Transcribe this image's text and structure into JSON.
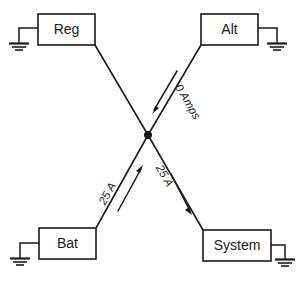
{
  "diagram": {
    "background_color": "#ffffff",
    "line_color": "#1a1a1a",
    "nodes": [
      {
        "id": "reg",
        "label": "Reg",
        "position": "top-left",
        "ground_side": "left"
      },
      {
        "id": "alt",
        "label": "Alt",
        "position": "top-right",
        "ground_side": "right"
      },
      {
        "id": "bat",
        "label": "Bat",
        "position": "bottom-left",
        "ground_side": "left"
      },
      {
        "id": "system",
        "label": "System",
        "position": "bottom-right",
        "ground_side": "right"
      }
    ],
    "junction": {
      "label": "junction",
      "x": 148,
      "y": 135
    },
    "connections": [
      {
        "id": "reg-junction",
        "from": "reg",
        "to": "junction",
        "label": "",
        "arrow": "none"
      },
      {
        "id": "alt-junction",
        "from": "alt",
        "to": "junction",
        "label": "0 Amps",
        "arrow": "toward-junction"
      },
      {
        "id": "bat-junction",
        "from": "bat",
        "to": "junction",
        "label": "25 A",
        "arrow": "toward-junction"
      },
      {
        "id": "junction-system",
        "from": "junction",
        "to": "system",
        "label": "25 A",
        "arrow": "away-from-junction"
      }
    ],
    "labels": {
      "alt_flow": "0 Amps",
      "bat_flow": "25 A",
      "system_flow": "25 A"
    },
    "ground_symbol": "earth-ground"
  }
}
